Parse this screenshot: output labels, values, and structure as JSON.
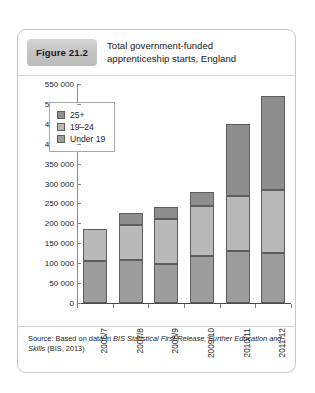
{
  "figure": {
    "badge": "Figure 21.2",
    "title_line1": "Total government-funded",
    "title_line2": "apprenticeship starts, England",
    "source_prefix": "Source: Based on data in ",
    "source_italic": "BIS Statistical First Release, Further Education and",
    "source_italic2": "Skills",
    "source_suffix": " (BIS, 2013)"
  },
  "chart_data": {
    "type": "bar",
    "subtype": "stacked-vertical",
    "title": "Total government-funded apprenticeship starts, England",
    "xlabel": "",
    "ylabel": "",
    "ylim": [
      0,
      550000
    ],
    "ytick_step": 50000,
    "grid": false,
    "legend_position": "top-left-inside",
    "categories": [
      "2006/7",
      "2007/8",
      "2008/9",
      "2009/10",
      "2010/11",
      "2011/12"
    ],
    "ytick_labels": [
      "550 000",
      "500 000",
      "450 000",
      "400 000",
      "350 000",
      "300 000",
      "250 000",
      "200 000",
      "150 000",
      "100 000",
      "50 000",
      "0"
    ],
    "ytick_values": [
      550000,
      500000,
      450000,
      400000,
      350000,
      300000,
      250000,
      200000,
      150000,
      100000,
      50000,
      0
    ],
    "series": [
      {
        "name": "Under 19",
        "color": "#9d9d9d",
        "values": [
          105000,
          107000,
          98000,
          117000,
          130000,
          125000
        ]
      },
      {
        "name": "19–24",
        "color": "#b9b9b9",
        "values": [
          80000,
          90000,
          112000,
          126000,
          140000,
          160000
        ]
      },
      {
        "name": "25+",
        "color": "#8e8e8e",
        "values": [
          0,
          28000,
          30000,
          37000,
          180000,
          235000
        ]
      }
    ],
    "stack_order_bottom_to_top": [
      "Under 19",
      "19–24",
      "25+"
    ],
    "totals": [
      185000,
      225000,
      240000,
      280000,
      450000,
      520000
    ]
  }
}
